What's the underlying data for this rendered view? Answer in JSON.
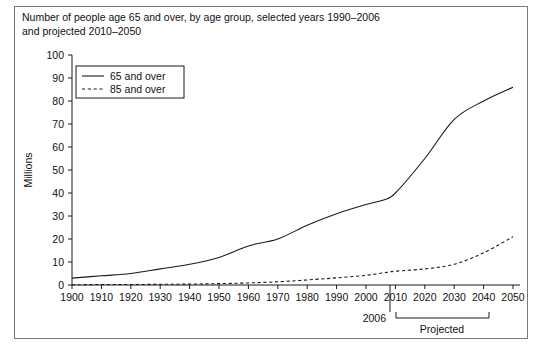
{
  "figure": {
    "title": "Number of people age 65 and over, by age group, selected years 1990–2006\nand projected 2010–2050"
  },
  "chart_data": {
    "type": "line",
    "title": "Number of people age 65 and over, by age group, selected years 1990–2006 and projected 2010–2050",
    "xlabel": "",
    "ylabel": "Millions",
    "xlim": [
      1900,
      2050
    ],
    "ylim": [
      0,
      100
    ],
    "grid": false,
    "legend_position": "top-left",
    "x": [
      1900,
      1910,
      1920,
      1930,
      1940,
      1950,
      1960,
      1970,
      1980,
      1990,
      2000,
      2006,
      2010,
      2020,
      2030,
      2040,
      2050
    ],
    "xticks": [
      "1900",
      "1910",
      "1920",
      "1930",
      "1940",
      "1950",
      "1960",
      "1970",
      "1980",
      "1990",
      "2000",
      "2010",
      "2020",
      "2030",
      "2040",
      "2050"
    ],
    "yticks": [
      "0",
      "10",
      "20",
      "30",
      "40",
      "50",
      "60",
      "70",
      "80",
      "90",
      "100"
    ],
    "series": [
      {
        "name": "65 and over",
        "style": "solid",
        "values": [
          3,
          4,
          5,
          7,
          9,
          12,
          17,
          20,
          26,
          31,
          35,
          37,
          40,
          55,
          72,
          80,
          86
        ]
      },
      {
        "name": "85 and over",
        "style": "dashed",
        "values": [
          0.1,
          0.2,
          0.2,
          0.3,
          0.4,
          0.6,
          0.9,
          1.4,
          2.2,
          3.1,
          4.2,
          5.3,
          6,
          7,
          9,
          14,
          21
        ]
      }
    ],
    "annotations": [
      {
        "name": "divider-2006",
        "label": "2006",
        "x": 2006,
        "type": "vertical-divider"
      },
      {
        "name": "projected-bracket",
        "label": "Projected",
        "from": 2010,
        "to": 2050,
        "type": "bracket"
      }
    ]
  },
  "legend": {
    "items": [
      {
        "label": "65 and over"
      },
      {
        "label": "85 and over"
      }
    ]
  },
  "axes": {
    "y_title": "Millions"
  },
  "annotations": {
    "divider_label": "2006",
    "projected_label": "Projected"
  }
}
